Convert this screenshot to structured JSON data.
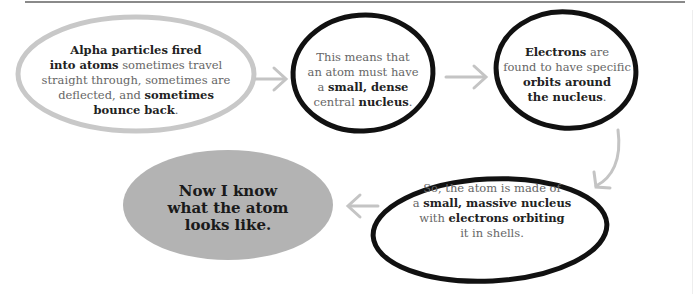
{
  "diagram": {
    "type": "flowchart",
    "nodes": [
      {
        "id": "n1",
        "style": "grey-outline",
        "segments": [
          {
            "t": "Alpha particles fired",
            "b": true
          },
          {
            "t": " into atoms",
            "b": true
          },
          {
            "t": " sometimes travel straight through, sometimes are deflected, and ",
            "b": false
          },
          {
            "t": "sometimes bounce back",
            "b": true
          },
          {
            "t": ".",
            "b": false
          }
        ]
      },
      {
        "id": "n2",
        "style": "black-outline",
        "segments": [
          {
            "t": "This means that an atom must have a ",
            "b": false
          },
          {
            "t": "small, dense",
            "b": true
          },
          {
            "t": " central ",
            "b": false
          },
          {
            "t": "nucleus",
            "b": true
          },
          {
            "t": ".",
            "b": false
          }
        ]
      },
      {
        "id": "n3",
        "style": "black-outline",
        "segments": [
          {
            "t": "Electrons",
            "b": true
          },
          {
            "t": " are found to have specific ",
            "b": false
          },
          {
            "t": "orbits around the nucleus",
            "b": true
          },
          {
            "t": ".",
            "b": false
          }
        ]
      },
      {
        "id": "n4",
        "style": "black-outline",
        "segments": [
          {
            "t": "So, the atom is made of a ",
            "b": false
          },
          {
            "t": "small, massive nucleus",
            "b": true
          },
          {
            "t": " with ",
            "b": false
          },
          {
            "t": "electrons orbiting",
            "b": true
          },
          {
            "t": " it in shells.",
            "b": false
          }
        ]
      },
      {
        "id": "n5",
        "style": "grey-filled",
        "text": "Now I know what the atom looks like."
      }
    ],
    "edges": [
      [
        "n1",
        "n2"
      ],
      [
        "n2",
        "n3"
      ],
      [
        "n3",
        "n4"
      ],
      [
        "n4",
        "n5"
      ]
    ],
    "colors": {
      "grey_outline": "#c8c8c8",
      "black_outline": "#111111",
      "filled": "#b3b3b3",
      "arrow": "#c4c4c4"
    }
  },
  "n1": {
    "l1a": "Alpha particles fired",
    "l2a": "into atoms",
    "l2b": " sometimes travel",
    "l3": "straight through, sometimes are",
    "l4a": "deflected, and ",
    "l4b": "sometimes",
    "l5a": "bounce back",
    "l5b": "."
  },
  "n2": {
    "l1": "This means that",
    "l2": "an atom must have",
    "l3a": "a ",
    "l3b": "small, dense",
    "l4a": "central ",
    "l4b": "nucleus",
    "l4c": "."
  },
  "n3": {
    "l1a": "Electrons",
    "l1b": " are",
    "l2": "found to have specific",
    "l3": "orbits around",
    "l4a": "the nucleus",
    "l4b": "."
  },
  "n4": {
    "l1": "So, the atom is made of",
    "l2a": "a ",
    "l2b": "small, massive nucleus",
    "l3a": "with ",
    "l3b": "electrons orbiting",
    "l4": "it in shells."
  },
  "n5": {
    "l1": "Now I know",
    "l2": "what the atom",
    "l3": "looks like."
  }
}
